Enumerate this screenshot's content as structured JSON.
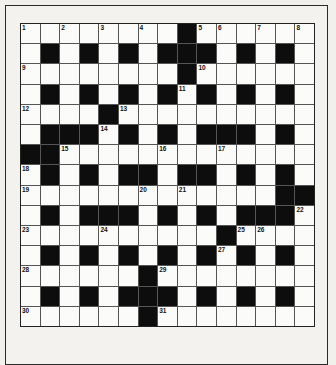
{
  "puzzle": {
    "rows": 15,
    "cols": 15,
    "layout": [
      "########.######",
      "#.#.#.#...#.#.#",
      "########.######",
      "#.#.#.#.#.#.#.#",
      "####.##########",
      "#...#.#.#...#.#",
      "..#############",
      "#.#.#..#..#.#.#",
      "#############..",
      "#.#...#.#.#...#",
      "##########.####",
      "#.#.#.#.#.#.#.#",
      "######.########",
      "#.#.#...#.#.#.#",
      "######.########"
    ],
    "legend": {
      "#": "white-cell",
      ".": "black-cell"
    },
    "numbers": [
      {
        "n": "1",
        "r": 0,
        "c": 0
      },
      {
        "n": "2",
        "r": 0,
        "c": 2
      },
      {
        "n": "3",
        "r": 0,
        "c": 4
      },
      {
        "n": "4",
        "r": 0,
        "c": 6
      },
      {
        "n": "5",
        "r": 0,
        "c": 9
      },
      {
        "n": "6",
        "r": 0,
        "c": 10
      },
      {
        "n": "7",
        "r": 0,
        "c": 12
      },
      {
        "n": "8",
        "r": 0,
        "c": 14
      },
      {
        "n": "9",
        "r": 2,
        "c": 0
      },
      {
        "n": "10",
        "r": 2,
        "c": 9
      },
      {
        "n": "11",
        "r": 3,
        "c": 8
      },
      {
        "n": "12",
        "r": 4,
        "c": 0
      },
      {
        "n": "13",
        "r": 4,
        "c": 5
      },
      {
        "n": "14",
        "r": 5,
        "c": 4
      },
      {
        "n": "15",
        "r": 6,
        "c": 2
      },
      {
        "n": "16",
        "r": 6,
        "c": 7
      },
      {
        "n": "17",
        "r": 6,
        "c": 10
      },
      {
        "n": "18",
        "r": 7,
        "c": 0
      },
      {
        "n": "19",
        "r": 8,
        "c": 0
      },
      {
        "n": "20",
        "r": 8,
        "c": 6
      },
      {
        "n": "21",
        "r": 8,
        "c": 8
      },
      {
        "n": "22",
        "r": 9,
        "c": 14
      },
      {
        "n": "23",
        "r": 10,
        "c": 0
      },
      {
        "n": "24",
        "r": 10,
        "c": 4
      },
      {
        "n": "25",
        "r": 10,
        "c": 11
      },
      {
        "n": "26",
        "r": 10,
        "c": 12
      },
      {
        "n": "27",
        "r": 11,
        "c": 10
      },
      {
        "n": "28",
        "r": 12,
        "c": 0
      },
      {
        "n": "29",
        "r": 12,
        "c": 7
      },
      {
        "n": "30",
        "r": 14,
        "c": 0
      },
      {
        "n": "31",
        "r": 14,
        "c": 7
      }
    ],
    "colors": {
      "black_cell": "#0d0d0d",
      "white_cell": "#fbfbf9",
      "background": "#f1f0ec"
    }
  }
}
